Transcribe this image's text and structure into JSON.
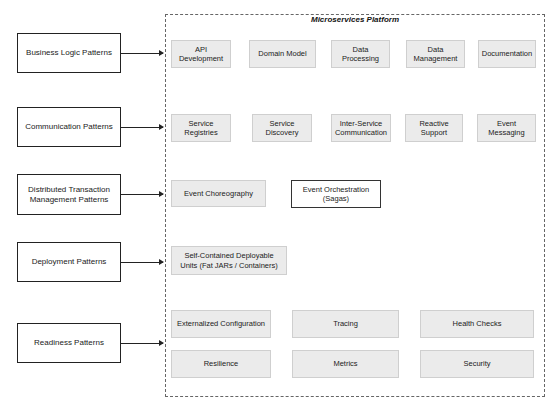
{
  "platform": {
    "title": "Microservices Platform"
  },
  "patterns": [
    {
      "label": "Business Logic Patterns"
    },
    {
      "label": "Communication Patterns"
    },
    {
      "label": "Distributed Transaction Management Patterns"
    },
    {
      "label": "Deployment Patterns"
    },
    {
      "label": "Readiness Patterns"
    }
  ],
  "business_logic": [
    {
      "label": "API Development"
    },
    {
      "label": "Domain Model"
    },
    {
      "label": "Data Processing"
    },
    {
      "label": "Data Management"
    },
    {
      "label": "Documentation"
    }
  ],
  "communication": [
    {
      "label": "Service Registries"
    },
    {
      "label": "Service Discovery"
    },
    {
      "label": "Inter-Service Communication"
    },
    {
      "label": "Reactive Support"
    },
    {
      "label": "Event Messaging"
    }
  ],
  "distributed_transaction": [
    {
      "label": "Event Choreography"
    },
    {
      "label": "Event Orchestration (Sagas)"
    }
  ],
  "deployment": [
    {
      "label": "Self-Contained Deployable Units (Fat JARs / Containers)"
    }
  ],
  "readiness": [
    {
      "label": "Externalized Configuration"
    },
    {
      "label": "Tracing"
    },
    {
      "label": "Health Checks"
    },
    {
      "label": "Resilience"
    },
    {
      "label": "Metrics"
    },
    {
      "label": "Security"
    }
  ],
  "colors": {
    "node_fill": "#ebebeb",
    "node_border": "#cfcfcf",
    "outline": "#222222"
  }
}
